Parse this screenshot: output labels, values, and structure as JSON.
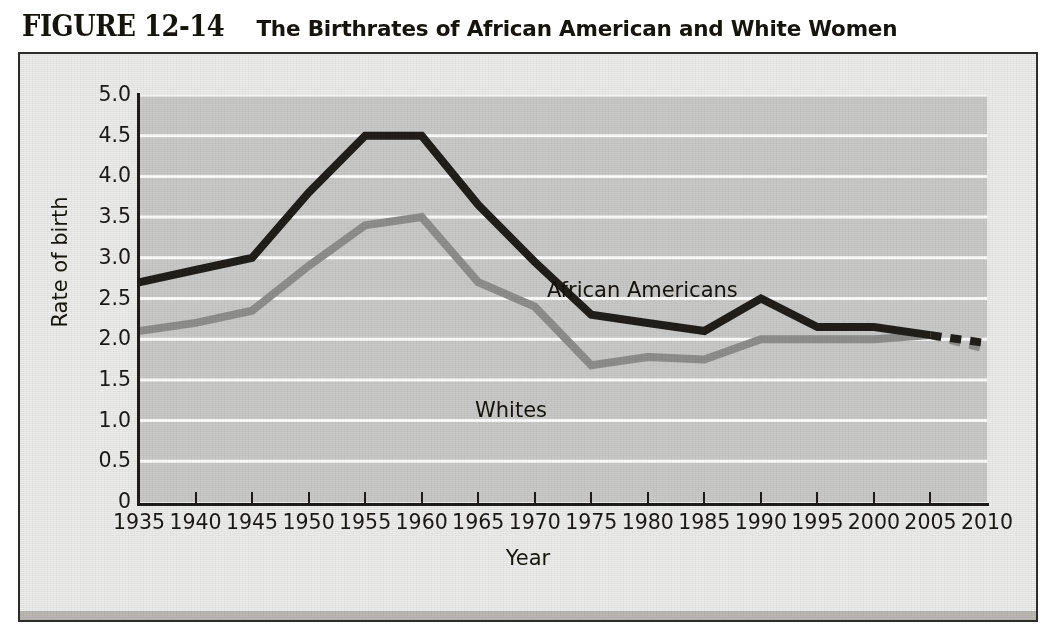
{
  "figure": {
    "number": "FIGURE 12-14",
    "caption": "The Birthrates of African American and White Women"
  },
  "axis": {
    "y_title": "Rate of birth",
    "x_title": "Year",
    "y_ticks": [
      "5.0",
      "4.5",
      "4.0",
      "3.5",
      "3.0",
      "2.5",
      "2.0",
      "1.5",
      "1.0",
      "0.5",
      "0"
    ],
    "x_ticks": [
      "1935",
      "1940",
      "1945",
      "1950",
      "1955",
      "1960",
      "1965",
      "1970",
      "1975",
      "1980",
      "1985",
      "1990",
      "1995",
      "2000",
      "2005",
      "2010"
    ]
  },
  "labels": {
    "african_americans": "African Americans",
    "whites": "Whites"
  },
  "colors": {
    "african_americans_line": "#1f1e1b",
    "whites_line": "#8e8e8c",
    "plot_background": "#c9c9c7",
    "gridline": "#fdfdfd",
    "panel_background": "#ececea",
    "frame": "#2e2c28"
  },
  "chart_data": {
    "type": "line",
    "title": "The Birthrates of African American and White Women",
    "xlabel": "Year",
    "ylabel": "Rate of birth",
    "xlim": [
      1935,
      2010
    ],
    "ylim": [
      0,
      5.0
    ],
    "ytick_values": [
      5.0,
      4.5,
      4.0,
      3.5,
      3.0,
      2.5,
      2.0,
      1.5,
      1.0,
      0.5,
      0
    ],
    "grid": "horizontal",
    "legend": "inline-labels",
    "x": [
      1935,
      1940,
      1945,
      1950,
      1955,
      1960,
      1965,
      1970,
      1975,
      1980,
      1985,
      1990,
      1995,
      2000,
      2005,
      2010
    ],
    "series": [
      {
        "name": "African Americans",
        "color": "#1f1e1b",
        "values": [
          2.7,
          2.85,
          3.0,
          3.8,
          4.5,
          4.5,
          3.65,
          2.95,
          2.3,
          2.2,
          2.1,
          2.5,
          2.15,
          2.15,
          2.05,
          1.95
        ],
        "projected_from": 2005,
        "projected_style": "dashed"
      },
      {
        "name": "Whites",
        "color": "#8e8e8c",
        "values": [
          2.1,
          2.2,
          2.35,
          2.9,
          3.4,
          3.5,
          2.7,
          2.4,
          1.68,
          1.78,
          1.75,
          2.0,
          2.0,
          2.0,
          2.05,
          1.88
        ],
        "projected_from": 2005,
        "projected_style": "dashed"
      }
    ],
    "annotations": [
      {
        "text": "African Americans",
        "x": 1972,
        "y": 3.15
      },
      {
        "text": "Whites",
        "x": 1966,
        "y": 1.85
      }
    ]
  }
}
